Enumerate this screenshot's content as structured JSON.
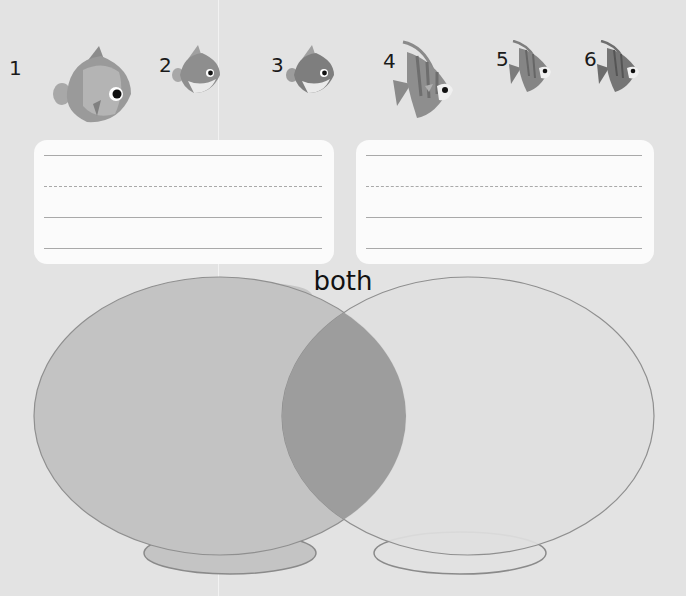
{
  "fish": [
    {
      "number": "1",
      "type": "butterflyfish",
      "size": "large"
    },
    {
      "number": "2",
      "type": "butterflyfish",
      "size": "small"
    },
    {
      "number": "3",
      "type": "butterflyfish",
      "size": "small"
    },
    {
      "number": "4",
      "type": "angelfish",
      "size": "large"
    },
    {
      "number": "5",
      "type": "angelfish",
      "size": "small"
    },
    {
      "number": "6",
      "type": "angelfish",
      "size": "small"
    }
  ],
  "writing_cards": [
    {
      "id": "left",
      "lines": [
        "solid",
        "dashed",
        "solid",
        "solid"
      ]
    },
    {
      "id": "right",
      "lines": [
        "solid",
        "dashed",
        "solid",
        "solid"
      ]
    }
  ],
  "venn": {
    "overlap_label": "both",
    "left_bowl_color": "#c3c3c3",
    "right_bowl_color": "#e0e0e0",
    "overlap_color": "#9d9d9d"
  }
}
